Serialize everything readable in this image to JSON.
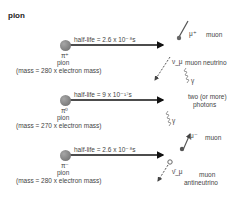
{
  "title": "pion",
  "decays": [
    {
      "symbol": "π⁺",
      "name": "pion",
      "mass": "(mass = 280 x electron mass)",
      "half_life": "half-life = 2.6 x 10⁻⁸s",
      "products": [
        {
          "symbol": "μ⁺",
          "label": "muon"
        },
        {
          "symbol": "ν_μ",
          "label": "muon neutrino"
        }
      ]
    },
    {
      "symbol": "π⁰",
      "name": "pion",
      "mass": "(mass = 270 x electron mass)",
      "half_life": "half-life = 9 x 10⁻¹⁷s",
      "products": [
        {
          "symbol": "γ",
          "label": "two (or more)"
        },
        {
          "symbol": "γ",
          "label": "photons"
        }
      ]
    },
    {
      "symbol": "π⁻",
      "name": "pion",
      "mass": "(mass = 280 x electron mass)",
      "half_life": "half-life = 2.6 x 10⁻⁸s",
      "products": [
        {
          "symbol": "μ⁻",
          "label": "muon"
        },
        {
          "symbol": "ν̄_μ",
          "label": "muon"
        },
        {
          "symbol": "",
          "label": "antineutrino"
        }
      ]
    }
  ]
}
